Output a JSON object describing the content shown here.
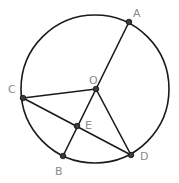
{
  "diagram": {
    "title": "",
    "circle": {
      "name": "circle-O",
      "center": "O"
    },
    "points": [
      {
        "id": "A",
        "label": "A"
      },
      {
        "id": "C",
        "label": "C"
      },
      {
        "id": "O",
        "label": "O"
      },
      {
        "id": "E",
        "label": "E"
      },
      {
        "id": "B",
        "label": "B"
      },
      {
        "id": "D",
        "label": "D"
      }
    ],
    "segments": [
      {
        "from": "O",
        "to": "A"
      },
      {
        "from": "C",
        "to": "O"
      },
      {
        "from": "C",
        "to": "D"
      },
      {
        "from": "O",
        "to": "B"
      },
      {
        "from": "O",
        "to": "D"
      }
    ],
    "colors": {
      "stroke": "#1a1a1a",
      "label": "#8a8a8a",
      "point": "#3a3a3a"
    }
  }
}
